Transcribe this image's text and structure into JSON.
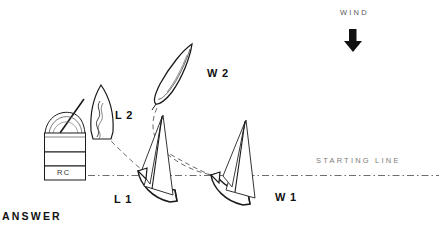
{
  "diagram": {
    "title_text": "ANSWER",
    "wind": {
      "label": "WIND",
      "arrow_icon": "down-arrow-icon",
      "direction": "down"
    },
    "starting_line": {
      "label": "STARTING LINE",
      "style": "dash-dot",
      "color": "#6e6e6e"
    },
    "committee_boat": {
      "label": "RC",
      "name": "race-committee-boat"
    },
    "boats": [
      {
        "id": "L2",
        "label": "L 2",
        "view": "overhead",
        "note": "leeward boat, second position"
      },
      {
        "id": "W2",
        "label": "W 2",
        "view": "overhead",
        "note": "windward boat, second position"
      },
      {
        "id": "L1",
        "label": "L 1",
        "view": "profile",
        "note": "leeward boat at start line"
      },
      {
        "id": "W1",
        "label": "W 1",
        "view": "profile",
        "note": "windward boat at start line"
      }
    ],
    "tracks": [
      {
        "from": "L2",
        "to": "L1",
        "style": "dashed"
      },
      {
        "from": "W2",
        "to": "W1",
        "style": "dashed"
      }
    ],
    "colors": {
      "ink": "#111111",
      "hull_line": "#1a1a1a",
      "sail_line": "#444444",
      "dash_track": "#6b6b6b",
      "start_line": "#6e6e6e",
      "background": "#ffffff"
    }
  }
}
